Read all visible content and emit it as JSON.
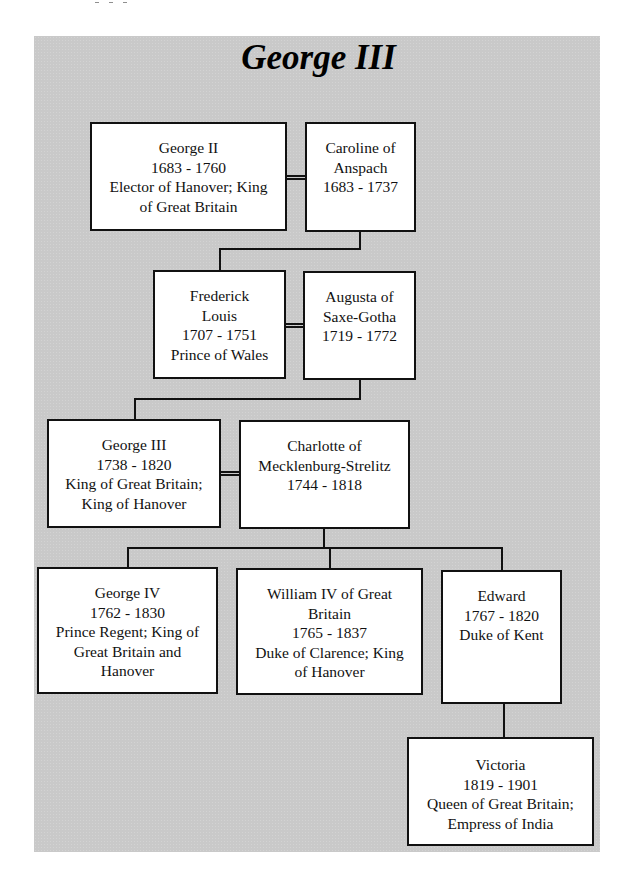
{
  "title": "George III",
  "people": {
    "george_ii": {
      "lines": [
        "George II",
        "1683 - 1760",
        "Elector of Hanover; King",
        "of Great Britain"
      ]
    },
    "caroline": {
      "lines": [
        "Caroline of",
        "Anspach",
        "1683 - 1737"
      ]
    },
    "frederick": {
      "lines": [
        "Frederick",
        "Louis",
        "1707 - 1751",
        "Prince of Wales"
      ]
    },
    "augusta": {
      "lines": [
        "Augusta of",
        "Saxe-Gotha",
        "1719 - 1772"
      ]
    },
    "george_iii": {
      "lines": [
        "George III",
        "1738 - 1820",
        "King of Great Britain;",
        "King of Hanover"
      ]
    },
    "charlotte": {
      "lines": [
        "Charlotte of",
        "Mecklenburg-Strelitz",
        "1744 - 1818"
      ]
    },
    "george_iv": {
      "lines": [
        "George IV",
        "1762 - 1830",
        "Prince Regent; King of",
        "Great Britain and",
        "Hanover"
      ]
    },
    "william_iv": {
      "lines": [
        "William IV of Great",
        "Britain",
        "1765 - 1837",
        "Duke of Clarence; King",
        "of Hanover"
      ]
    },
    "edward": {
      "lines": [
        "Edward",
        "1767 - 1820",
        "Duke of Kent"
      ]
    },
    "victoria": {
      "lines": [
        "Victoria",
        "1819 - 1901",
        "Queen of Great Britain;",
        "Empress of India"
      ]
    }
  },
  "colors": {
    "panel": "#c9c9c9",
    "box": "#ffffff",
    "line": "#111111"
  }
}
